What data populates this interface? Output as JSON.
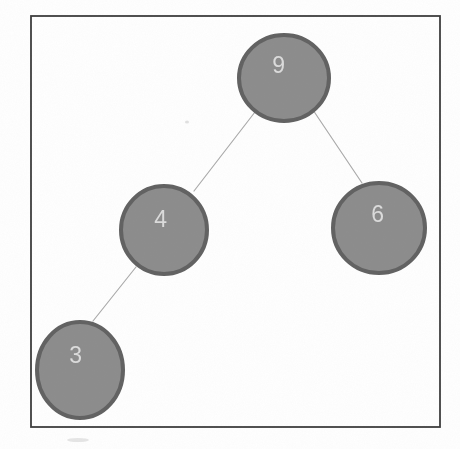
{
  "figure": {
    "background": "#ffffff",
    "frame": {
      "x": 31,
      "y": 16,
      "width": 409,
      "height": 411,
      "border_color": "#3c3c3c",
      "border_width": 1.8
    },
    "style": {
      "node_fill": "#8c8c8c",
      "node_stroke": "#616161",
      "node_stroke_width": 4,
      "label_color": "#dcdcdc",
      "label_font_size": 23,
      "edge_color": "#ababab",
      "edge_width": 1.2
    },
    "nodes": [
      {
        "id": "9",
        "label": "9",
        "cx": 284,
        "cy": 78,
        "rx": 45,
        "ry": 43,
        "lx": 279,
        "ly": 65
      },
      {
        "id": "4",
        "label": "4",
        "cx": 164,
        "cy": 230,
        "rx": 43,
        "ry": 44,
        "lx": 161,
        "ly": 219
      },
      {
        "id": "6",
        "label": "6",
        "cx": 379,
        "cy": 228,
        "rx": 46,
        "ry": 45,
        "lx": 378,
        "ly": 214
      },
      {
        "id": "3",
        "label": "3",
        "cx": 80,
        "cy": 370,
        "rx": 43,
        "ry": 48,
        "lx": 76,
        "ly": 355
      }
    ],
    "edges": [
      {
        "from": "9",
        "to": "4",
        "x1": 255,
        "y1": 112,
        "x2": 194,
        "y2": 191
      },
      {
        "from": "9",
        "to": "6",
        "x1": 313,
        "y1": 110,
        "x2": 362,
        "y2": 183
      },
      {
        "from": "4",
        "to": "3",
        "x1": 136,
        "y1": 267,
        "x2": 93,
        "y2": 321
      }
    ],
    "artifacts": [
      {
        "cx": 187,
        "cy": 122,
        "rx": 2,
        "ry": 1.5,
        "opacity": 0.3
      },
      {
        "cx": 78,
        "cy": 440,
        "rx": 11,
        "ry": 2,
        "opacity": 0.25
      }
    ]
  }
}
